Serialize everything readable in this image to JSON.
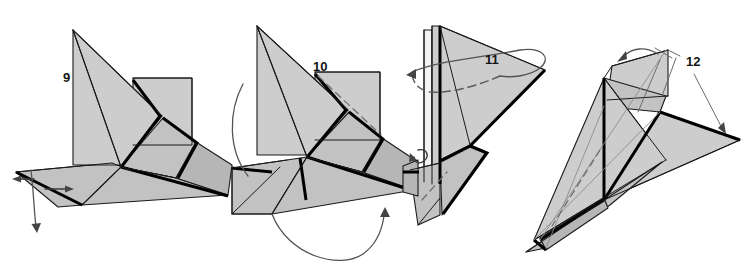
{
  "page": {
    "width": 748,
    "height": 270,
    "background_color": "#ffffff"
  },
  "palette": {
    "paper_light": "#cdcdcd",
    "paper_mid": "#c2c2c2",
    "paper_dark": "#b6b6b6",
    "paper_white": "#f4f4f4",
    "edge_color": "#1a1a1a",
    "thick_edge_color": "#000000",
    "hidden_crease_color": "#6e6e6e",
    "arrow_color": "#545454",
    "label_color": "#141414"
  },
  "figures": [
    {
      "id": "figure-9",
      "step_label": "9",
      "label_x": 63,
      "label_y": 82,
      "description": "Partially folded model seen from above, flaps spread outward"
    },
    {
      "id": "figure-10",
      "step_label": "10",
      "label_x": 313,
      "label_y": 71,
      "description": "Model rotated, with wing flaps folding toward the centre"
    },
    {
      "id": "figure-11",
      "step_label": "11",
      "label_x": 485,
      "label_y": 64,
      "description": "Model narrowed with a wrap-around fold on the upper flap"
    },
    {
      "id": "figure-12",
      "step_label": "12",
      "label_x": 686,
      "label_y": 66,
      "description": "Finished dart shape with wings swept back"
    }
  ],
  "annotations": [
    {
      "id": "arrow-left-small",
      "type": "straight-arrow",
      "direction": "left",
      "figure": "figure-9"
    },
    {
      "id": "arrow-right-small",
      "type": "straight-arrow",
      "direction": "right",
      "figure": "figure-9"
    },
    {
      "id": "arrow-curved-down",
      "type": "curved-arrow",
      "direction": "down",
      "figure": "figure-9"
    },
    {
      "id": "arrow-arc-left",
      "type": "arc",
      "direction": "none",
      "figure": "figure-10"
    },
    {
      "id": "arrow-rotate-bottom",
      "type": "curved-arrow",
      "direction": "up",
      "figure": "figure-10"
    },
    {
      "id": "arrow-curl-small",
      "type": "curl-arrow",
      "direction": "left",
      "figure": "figure-11"
    },
    {
      "id": "arrow-wrap-dashed",
      "type": "dashed-loop-arrow",
      "direction": "left",
      "figure": "figure-11"
    },
    {
      "id": "arrow-fold-left",
      "type": "curved-arrow",
      "direction": "left",
      "figure": "figure-12"
    },
    {
      "id": "leader-lines-12",
      "type": "leader-lines",
      "direction": "none",
      "figure": "figure-12"
    }
  ]
}
